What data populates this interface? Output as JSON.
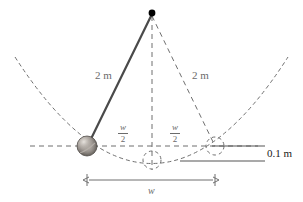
{
  "figure": {
    "labels": {
      "rod_left": "2 m",
      "rod_right": "2 m",
      "half_width_left_num": "w",
      "half_width_left_den": "2",
      "half_width_right_num": "w",
      "half_width_right_den": "2",
      "depth": "0.1 m",
      "width": "w"
    },
    "colors": {
      "rod": "#4a4a4a",
      "dashed": "#6f6f6f",
      "ball_dark": "#5a5652",
      "ball_light": "#cfcac4",
      "text": "#6b6b6b",
      "text_dark": "#1a1a1a",
      "solid_line": "#555555",
      "pivot": "#000000"
    },
    "geometry": {
      "pivot": {
        "x": 152,
        "y": 13
      },
      "bob": {
        "x": 87,
        "y": 146,
        "r": 10
      },
      "bottom_circle": {
        "x": 152,
        "y": 160,
        "r": 9
      },
      "right_circle": {
        "x": 215,
        "y": 146,
        "r": 9
      },
      "parabola_left_end": {
        "x": 15,
        "y": 57
      },
      "parabola_right_end": {
        "x": 288,
        "y": 57
      },
      "parabola_vertex": {
        "x": 152,
        "y": 163
      },
      "baseline_y": 146,
      "depth_line_y": 161,
      "dimension_y": 180,
      "dimension_x1": 87,
      "dimension_x2": 215
    }
  }
}
